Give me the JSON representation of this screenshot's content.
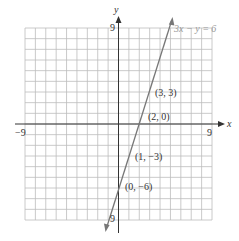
{
  "figure": {
    "x_axis_label": "x",
    "y_axis_label": "y",
    "x_min_label": "−9",
    "x_max_label": "9",
    "y_max_label": "9",
    "y_min_label": "9",
    "equation": "3x − y = 6",
    "points": [
      {
        "x": 3,
        "y": 3,
        "label": "(3, 3)"
      },
      {
        "x": 2,
        "y": 0,
        "label": "(2, 0)"
      },
      {
        "x": 1,
        "y": -3,
        "label": "(1, −3)"
      },
      {
        "x": 0,
        "y": -6,
        "label": "(0, −6)"
      }
    ],
    "grid": {
      "x_range": [
        -9,
        9
      ],
      "y_range": [
        -9,
        9
      ],
      "step": 1
    },
    "colors": {
      "grid": "#b8b8b8",
      "axis": "#333333",
      "line": "#777777",
      "equation": "#999999"
    }
  }
}
